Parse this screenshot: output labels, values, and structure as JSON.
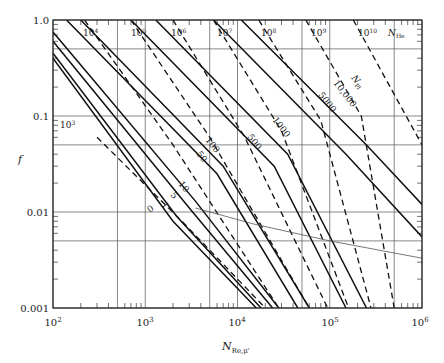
{
  "chart_data": {
    "type": "line",
    "title": "",
    "xlabel": "N_Re,μ'",
    "ylabel": "f",
    "xscale": "log",
    "yscale": "log",
    "xlim": [
      100,
      1000000
    ],
    "ylim": [
      0.001,
      1.0
    ],
    "grid": true,
    "x_ticks": [
      "10²",
      "10³",
      "10⁴",
      "10⁵",
      "10⁶"
    ],
    "y_ticks": [
      "1.0",
      "0.1",
      "0.01",
      "0.001"
    ],
    "x_gridlines": [
      100,
      500,
      1000,
      5000,
      10000,
      50000,
      100000,
      500000,
      1000000
    ],
    "y_gridlines": [
      1.0,
      0.5,
      0.1,
      0.05,
      0.01,
      0.005,
      0.001
    ],
    "families": [
      {
        "name": "N_Pl",
        "style": "solid",
        "label": "N_Pl",
        "series": [
          {
            "name": "0",
            "points": [
              [
                100,
                0.4
              ],
              [
                2000,
                0.008
              ],
              [
                16000,
                0.001
              ]
            ]
          },
          {
            "name": "1",
            "points": [
              [
                100,
                0.45
              ],
              [
                2200,
                0.009
              ],
              [
                18000,
                0.001
              ]
            ]
          },
          {
            "name": "5",
            "points": [
              [
                100,
                0.6
              ],
              [
                3000,
                0.011
              ],
              [
                24000,
                0.001
              ]
            ]
          },
          {
            "name": "10",
            "points": [
              [
                100,
                0.75
              ],
              [
                3500,
                0.013
              ],
              [
                28000,
                0.001
              ]
            ]
          },
          {
            "name": "50",
            "points": [
              [
                140,
                1.0
              ],
              [
                6000,
                0.025
              ],
              [
                45000,
                0.001
              ]
            ]
          },
          {
            "name": "100",
            "points": [
              [
                200,
                1.0
              ],
              [
                7000,
                0.03
              ],
              [
                60000,
                0.001
              ]
            ]
          },
          {
            "name": "500",
            "points": [
              [
                700,
                1.0
              ],
              [
                25000,
                0.03
              ],
              [
                150000,
                0.001
              ]
            ]
          },
          {
            "name": "1000",
            "points": [
              [
                1300,
                1.0
              ],
              [
                35000,
                0.04
              ],
              [
                250000,
                0.001
              ]
            ]
          },
          {
            "name": "5000",
            "points": [
              [
                5500,
                1.0
              ],
              [
                150000,
                0.04
              ],
              [
                1000000,
                0.0055
              ]
            ]
          },
          {
            "name": "10,000",
            "points": [
              [
                11000,
                1.0
              ],
              [
                250000,
                0.05
              ],
              [
                1000000,
                0.012
              ]
            ]
          }
        ]
      },
      {
        "name": "N_He",
        "style": "dashed",
        "label": "N_He",
        "series": [
          {
            "name": "10³",
            "points": [
              [
                300,
                0.06
              ],
              [
                2500,
                0.008
              ],
              [
                20000,
                0.001
              ]
            ]
          },
          {
            "name": "10⁴",
            "points": [
              [
                220,
                1.0
              ],
              [
                2000,
                0.05
              ],
              [
                28000,
                0.001
              ]
            ]
          },
          {
            "name": "10⁵",
            "points": [
              [
                700,
                1.0
              ],
              [
                5000,
                0.06
              ],
              [
                60000,
                0.001
              ]
            ]
          },
          {
            "name": "10⁶",
            "points": [
              [
                2000,
                1.0
              ],
              [
                12000,
                0.06
              ],
              [
                95000,
                0.001
              ]
            ]
          },
          {
            "name": "10⁷",
            "points": [
              [
                5500,
                1.0
              ],
              [
                30000,
                0.07
              ],
              [
                160000,
                0.001
              ]
            ]
          },
          {
            "name": "10⁸",
            "points": [
              [
                17000,
                1.0
              ],
              [
                80000,
                0.09
              ],
              [
                280000,
                0.001
              ]
            ]
          },
          {
            "name": "10⁹",
            "points": [
              [
                55000,
                1.0
              ],
              [
                220000,
                0.1
              ],
              [
                500000,
                0.001
              ]
            ]
          },
          {
            "name": "10¹⁰",
            "points": [
              [
                180000,
                1.0
              ],
              [
                1000000,
                0.05
              ]
            ]
          }
        ]
      },
      {
        "name": "laminar-turbulent transition",
        "style": "thin",
        "series": [
          {
            "name": "transition",
            "points": [
              [
                3500,
                0.011
              ],
              [
                15000,
                0.0075
              ],
              [
                100000,
                0.005
              ],
              [
                1000000,
                0.0033
              ]
            ]
          }
        ]
      }
    ],
    "annotations": [
      "N_Pl",
      "N_He",
      "10,000",
      "5000",
      "1000",
      "500",
      "100",
      "50",
      "10",
      "5",
      "1",
      "0",
      "10³",
      "10⁴",
      "10⁵",
      "10⁶",
      "10⁷",
      "10⁸",
      "10⁹",
      "10¹⁰"
    ]
  },
  "axes": {
    "x_title_main": "N",
    "x_title_sub": "Re,μ'",
    "y_title": "f",
    "x_tick_labels": [
      {
        "base": "10",
        "exp": "2"
      },
      {
        "base": "10",
        "exp": "3"
      },
      {
        "base": "10",
        "exp": "4"
      },
      {
        "base": "10",
        "exp": "5"
      },
      {
        "base": "10",
        "exp": "6"
      }
    ],
    "y_tick_labels": [
      "1.0",
      "0.1",
      "0.01",
      "0.001"
    ]
  },
  "labels": {
    "pl_title_main": "N",
    "pl_title_sub": "Pl",
    "he_title_main": "N",
    "he_title_sub": "He",
    "pl_values": [
      "10,000",
      "5000",
      "1000",
      "500",
      "100",
      "50",
      "10",
      "5",
      "1",
      "0"
    ],
    "he_values": [
      {
        "base": "10",
        "exp": "3"
      },
      {
        "base": "10",
        "exp": "4"
      },
      {
        "base": "10",
        "exp": "5"
      },
      {
        "base": "10",
        "exp": "6"
      },
      {
        "base": "10",
        "exp": "7"
      },
      {
        "base": "10",
        "exp": "8"
      },
      {
        "base": "10",
        "exp": "9"
      },
      {
        "base": "10",
        "exp": "10"
      }
    ]
  }
}
